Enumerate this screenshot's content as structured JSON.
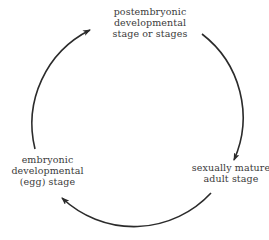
{
  "diagram": {
    "direction": "clockwise",
    "stages": [
      {
        "id": "postembryonic",
        "lines": [
          "postembryonic",
          "developmental",
          "stage or stages"
        ]
      },
      {
        "id": "adult",
        "lines": [
          "sexually mature",
          "adult stage"
        ]
      },
      {
        "id": "embryonic",
        "lines": [
          "embryonic",
          "developmental",
          "(egg) stage"
        ]
      }
    ],
    "arrows": [
      {
        "from": "postembryonic",
        "to": "adult"
      },
      {
        "from": "adult",
        "to": "embryonic"
      },
      {
        "from": "embryonic",
        "to": "postembryonic"
      }
    ],
    "colors": {
      "line": "#2b2b2b",
      "text": "#3a3a3a",
      "background": "#ffffff"
    }
  }
}
